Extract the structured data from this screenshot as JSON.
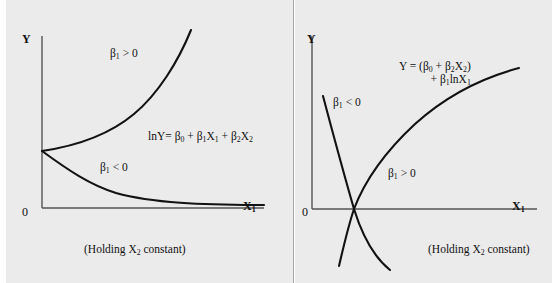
{
  "figure": {
    "background_color": "#ebebeb",
    "page_color": "#ffffff",
    "curve_color": "#121212",
    "axis_color": "#555555"
  },
  "panels": [
    {
      "id": "left",
      "model": "log-lin",
      "axes": {
        "y_label": "Y",
        "x_label_base": "X",
        "x_label_sub": "1",
        "origin_label": "0"
      },
      "equation": {
        "lhs": "lnY= ",
        "terms": [
          {
            "base": "β",
            "sub": "0"
          },
          {
            "base": "β",
            "sub": "1",
            "var": "X",
            "var_sub": "1"
          },
          {
            "base": "β",
            "sub": "2",
            "var": "X",
            "var_sub": "2"
          }
        ],
        "text": "lnY= β0 + β1X1 + β2X2"
      },
      "annotations": [
        {
          "name": "beta1-positive",
          "base": "β",
          "sub": "1",
          "rel": " > 0",
          "text": "β1 > 0"
        },
        {
          "name": "beta1-negative",
          "base": "β",
          "sub": "1",
          "rel": " < 0",
          "text": "β1 < 0"
        }
      ],
      "caption": {
        "prefix": "(Holding X",
        "sub": "2",
        "suffix": " constant)",
        "text": "(Holding X2 constant)"
      }
    },
    {
      "id": "right",
      "model": "lin-log",
      "axes": {
        "y_label": "Y",
        "x_label_base": "X",
        "x_label_sub": "1",
        "origin_label": "0"
      },
      "equation": {
        "line1": "Y = (β0 + β2X2)",
        "line2": "+ β1lnX1"
      },
      "annotations": [
        {
          "name": "beta1-negative",
          "base": "β",
          "sub": "1",
          "rel": " < 0",
          "text": "β1 < 0"
        },
        {
          "name": "beta1-positive",
          "base": "β",
          "sub": "1",
          "rel": " > 0",
          "text": "β1 > 0"
        }
      ],
      "caption": {
        "prefix": "(Holding X",
        "sub": "2",
        "suffix": " constant)",
        "text": "(Holding X2 constant)"
      }
    }
  ],
  "chart_data": [
    {
      "type": "line",
      "title": "Log-lin model",
      "xlabel": "X1",
      "ylabel": "Y",
      "grid": false,
      "legend": "none",
      "annotations": [
        "β1 > 0",
        "β1 < 0",
        "lnY= β0 + β1X1 + β2X2",
        "(Holding X2 constant)"
      ],
      "axis_origin": "0",
      "xlim": [
        0,
        1
      ],
      "ylim": [
        0,
        1
      ],
      "series": [
        {
          "name": "beta1 > 0 (exponential growth)",
          "formula": "Y = exp(b0 + b1*X1), b1 > 0",
          "points": [
            [
              0.0,
              0.33
            ],
            [
              0.1,
              0.4
            ],
            [
              0.2,
              0.49
            ],
            [
              0.3,
              0.6
            ],
            [
              0.4,
              0.73
            ],
            [
              0.5,
              0.88
            ],
            [
              0.6,
              1.06
            ],
            [
              0.62,
              1.12
            ]
          ]
        },
        {
          "name": "beta1 < 0 (exponential decay)",
          "formula": "Y = exp(b0 + b1*X1), b1 < 0",
          "points": [
            [
              0.0,
              0.33
            ],
            [
              0.1,
              0.25
            ],
            [
              0.2,
              0.19
            ],
            [
              0.3,
              0.14
            ],
            [
              0.4,
              0.1
            ],
            [
              0.5,
              0.08
            ],
            [
              0.6,
              0.06
            ],
            [
              0.75,
              0.045
            ],
            [
              1.0,
              0.04
            ]
          ]
        }
      ]
    },
    {
      "type": "line",
      "title": "Lin-log model",
      "xlabel": "X1",
      "ylabel": "Y",
      "grid": false,
      "legend": "none",
      "annotations": [
        "β1 < 0",
        "β1 > 0",
        "Y = (β0 + β2X2) + β1lnX1",
        "(Holding X2 constant)"
      ],
      "axis_origin": "0",
      "xlim": [
        0,
        1
      ],
      "ylim": [
        -0.3,
        1
      ],
      "series": [
        {
          "name": "beta1 > 0 (concave increasing log)",
          "formula": "Y = (b0 + b2*X2) + b1*ln(X1), b1 > 0",
          "points": [
            [
              0.19,
              -0.28
            ],
            [
              0.22,
              -0.1
            ],
            [
              0.245,
              0.0
            ],
            [
              0.3,
              0.16
            ],
            [
              0.4,
              0.35
            ],
            [
              0.55,
              0.55
            ],
            [
              0.7,
              0.7
            ],
            [
              0.85,
              0.8
            ],
            [
              1.0,
              0.87
            ]
          ]
        },
        {
          "name": "beta1 < 0 (convex decreasing log)",
          "formula": "Y = (b0 + b2*X2) + b1*ln(X1), b1 < 0",
          "points": [
            [
              0.135,
              0.72
            ],
            [
              0.15,
              0.55
            ],
            [
              0.17,
              0.38
            ],
            [
              0.2,
              0.22
            ],
            [
              0.245,
              0.0
            ],
            [
              0.3,
              -0.13
            ],
            [
              0.38,
              -0.23
            ],
            [
              0.46,
              -0.29
            ]
          ]
        }
      ]
    }
  ]
}
